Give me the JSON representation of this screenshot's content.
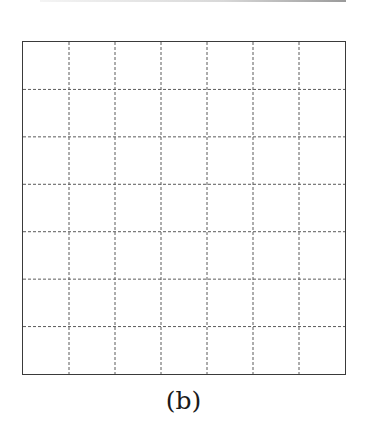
{
  "figure": {
    "caption": "(b)",
    "grid": {
      "rows": 7,
      "columns": 7,
      "border_color": "#3a3a3a",
      "line_color": "#5a5a5a",
      "line_style": "dashed"
    }
  }
}
